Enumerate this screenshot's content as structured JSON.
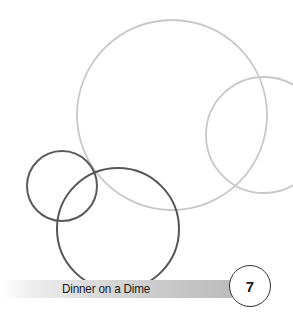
{
  "footer": {
    "title": "Dinner on a Dime",
    "page_number": "7"
  },
  "decor": {
    "light_circle_color": "#c8c8c8",
    "dark_circle_color": "#555555"
  }
}
